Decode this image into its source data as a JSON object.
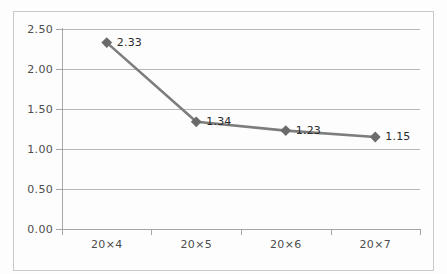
{
  "chart_data": {
    "type": "line",
    "title": "",
    "subtitle": "",
    "xlabel": "",
    "ylabel": "",
    "categories": [
      "20×4",
      "20×5",
      "20×6",
      "20×7"
    ],
    "values": [
      2.33,
      1.34,
      1.23,
      1.15
    ],
    "data_labels": [
      "2.33",
      "1.34",
      "1.23",
      "1.15"
    ],
    "series": [
      {
        "name": "",
        "values": [
          2.33,
          1.34,
          1.23,
          1.15
        ],
        "color": "#7d7d7d",
        "marker": "diamond"
      }
    ],
    "ylim": [
      0.0,
      2.5
    ],
    "yticks": [
      0.0,
      0.5,
      1.0,
      1.5,
      2.0,
      2.5
    ],
    "ytick_labels": [
      "0.00",
      "0.50",
      "1.00",
      "1.50",
      "2.00",
      "2.50"
    ],
    "grid": true,
    "grid_axis": "y",
    "legend": false,
    "legend_position": "none",
    "colors": {
      "line": "#7d7d7d",
      "marker": "#6b6b6b",
      "gridline": "#b7b7b7",
      "axis": "#a6a6a6",
      "frame": "#c9c9c9",
      "text": "#4d4d4d",
      "label_text": "#2b2b2b",
      "background": "#fdfdfd"
    }
  }
}
